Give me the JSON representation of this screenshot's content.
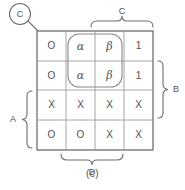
{
  "figure": {
    "caption": "(c)",
    "type": "karnaugh-map",
    "colors": {
      "line": "#6e6e6e",
      "text": "#4f4f4f",
      "background": "#ffffff"
    }
  },
  "grid": {
    "rows": 4,
    "cols": 4,
    "cells": [
      [
        "O",
        "α",
        "β",
        "1"
      ],
      [
        "O",
        "α",
        "β",
        "1"
      ],
      [
        "X",
        "X",
        "X",
        "X"
      ],
      [
        "O",
        "O",
        "X",
        "X"
      ]
    ]
  },
  "grouping": {
    "label": "alpha-beta-group",
    "covers_rows": [
      1,
      2
    ],
    "covers_cols": [
      2,
      3
    ]
  },
  "callout": {
    "label": "C",
    "points_to": "grid-top-left-corner"
  },
  "braces": {
    "top": {
      "label": "C",
      "covers_cols": [
        3,
        4
      ]
    },
    "right": {
      "label": "B",
      "covers_rows": [
        2,
        3
      ]
    },
    "left": {
      "label": "A",
      "covers_rows": [
        3,
        4
      ]
    },
    "bottom": {
      "label": "D",
      "covers_cols": [
        2,
        3
      ]
    }
  }
}
